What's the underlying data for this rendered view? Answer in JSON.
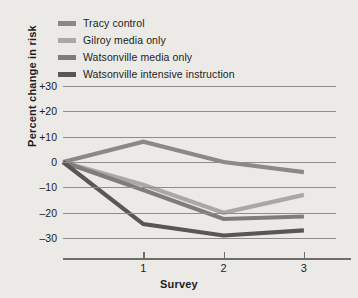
{
  "chart_data": {
    "type": "line",
    "title": "",
    "xlabel": "Survey",
    "ylabel": "Percent change in risk",
    "x": [
      0,
      1,
      2,
      3
    ],
    "xtick_labels": [
      "1",
      "2",
      "3"
    ],
    "xtick_values": [
      1,
      2,
      3
    ],
    "ytick_labels": [
      "+30",
      "+20",
      "+10",
      "0",
      "-10",
      "-20",
      "-30"
    ],
    "ytick_values": [
      30,
      20,
      10,
      0,
      -10,
      -20,
      -30
    ],
    "ylim": [
      -34,
      33
    ],
    "xlim": [
      0,
      3.4
    ],
    "grid": true,
    "legend_position": "top-left",
    "series": [
      {
        "name": "Tracy control",
        "color": "#8a8986",
        "values": [
          0,
          8,
          0,
          -4
        ]
      },
      {
        "name": "Gilroy media only",
        "color": "#a9a8a4",
        "values": [
          0,
          -9,
          -20,
          -13
        ]
      },
      {
        "name": "Watsonville media only",
        "color": "#7e7d7a",
        "values": [
          0,
          -11,
          -22.5,
          -21.5
        ]
      },
      {
        "name": "Watsonville intensive instruction",
        "color": "#59585６",
        "values": [
          0,
          -24.5,
          -29,
          -27
        ]
      }
    ]
  },
  "legend": {
    "items": [
      {
        "label": "Tracy control",
        "color": "#8a8986"
      },
      {
        "label": "Gilroy media only",
        "color": "#a9a8a4"
      },
      {
        "label": "Watsonville media only",
        "color": "#7e7d7a"
      },
      {
        "label": "Watsonville intensive instruction",
        "color": "#585755"
      }
    ]
  },
  "axes": {
    "x_title": "Survey",
    "y_title": "Percent change in risk"
  }
}
